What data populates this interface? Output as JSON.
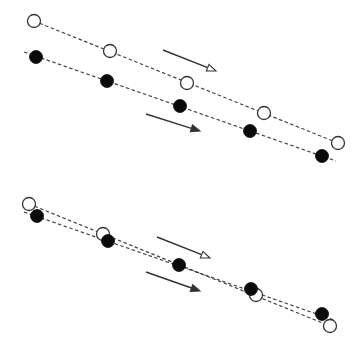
{
  "diagram": {
    "width": 363,
    "height": 352,
    "colors": {
      "background": "#ffffff",
      "line": "#333333",
      "dash": "#444444",
      "filled": "#0a0a0a",
      "open_stroke": "#333333",
      "open_fill": "#ffffff"
    },
    "marker_radius": 6.5,
    "panels": [
      {
        "name": "top-panel",
        "description": "Two parallel chains drifting right-downward; open markers lead the filled ones",
        "chains": [
          {
            "name": "open-chain",
            "style": "open",
            "line": [
              [
                34,
                21
              ],
              [
                338,
                143
              ]
            ],
            "points": [
              [
                34,
                21
              ],
              [
                110,
                51
              ],
              [
                187,
                83
              ],
              [
                264,
                113
              ],
              [
                338,
                143
              ]
            ]
          },
          {
            "name": "filled-chain",
            "style": "filled",
            "line": [
              [
                24,
                52
              ],
              [
                336,
                161
              ]
            ],
            "points": [
              [
                36,
                57
              ],
              [
                107,
                81
              ],
              [
                180,
                106
              ],
              [
                250,
                131
              ],
              [
                322,
                156
              ]
            ]
          }
        ],
        "arrows": [
          {
            "name": "open-arrow",
            "head": "open",
            "from": [
              163,
              50
            ],
            "to": [
              216,
              71
            ]
          },
          {
            "name": "filled-arrow",
            "head": "filled",
            "from": [
              146,
              114
            ],
            "to": [
              200,
              131
            ]
          }
        ]
      },
      {
        "name": "bottom-panel",
        "description": "Two nearly overlapping chains; open markers cross below the filled ones",
        "chains": [
          {
            "name": "open-chain",
            "style": "open",
            "line": [
              [
                29,
                204
              ],
              [
                330,
                326
              ]
            ],
            "points": [
              [
                29,
                204
              ],
              [
                103,
                234
              ],
              [
                256,
                295
              ],
              [
                330,
                326
              ]
            ]
          },
          {
            "name": "filled-chain",
            "style": "filled",
            "line": [
              [
                24,
                212
              ],
              [
                334,
                320
              ]
            ],
            "points": [
              [
                37,
                216
              ],
              [
                108,
                241
              ],
              [
                179,
                265
              ],
              [
                251,
                289
              ],
              [
                322,
                314
              ]
            ]
          }
        ],
        "arrows": [
          {
            "name": "open-arrow",
            "head": "open",
            "from": [
              157,
              237
            ],
            "to": [
              210,
              258
            ]
          },
          {
            "name": "filled-arrow",
            "head": "filled",
            "from": [
              146,
              272
            ],
            "to": [
              200,
              291
            ]
          }
        ]
      }
    ]
  }
}
